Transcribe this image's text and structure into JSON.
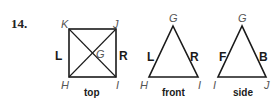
{
  "problem": {
    "number": "14."
  },
  "top_view": {
    "label": "top",
    "vertices": {
      "K": "K",
      "J": "J",
      "H": "H",
      "I": "I",
      "G": "G"
    },
    "faces": {
      "left": "L",
      "right": "R"
    }
  },
  "front_view": {
    "label": "front",
    "vertices": {
      "apex": "G",
      "left": "H",
      "right": "I"
    },
    "faces": {
      "left": "L",
      "right": "R"
    }
  },
  "side_view": {
    "label": "side",
    "vertices": {
      "apex": "G",
      "left": "I",
      "right": "J"
    },
    "faces": {
      "left": "F",
      "right": "B"
    }
  }
}
